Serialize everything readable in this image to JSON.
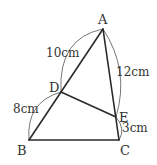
{
  "points": {
    "A": {
      "label": "A",
      "x": 103,
      "y": 29
    },
    "B": {
      "label": "B",
      "x": 29,
      "y": 140
    },
    "C": {
      "label": "C",
      "x": 119,
      "y": 140
    },
    "D": {
      "label": "D",
      "x": 61,
      "y": 92
    },
    "E": {
      "label": "E",
      "x": 116,
      "y": 117
    }
  },
  "measurements": {
    "AD": "10cm",
    "DB": "8cm",
    "AE": "12cm",
    "EC": "3cm"
  },
  "segments": [
    "AB",
    "AC",
    "BC",
    "DE"
  ]
}
